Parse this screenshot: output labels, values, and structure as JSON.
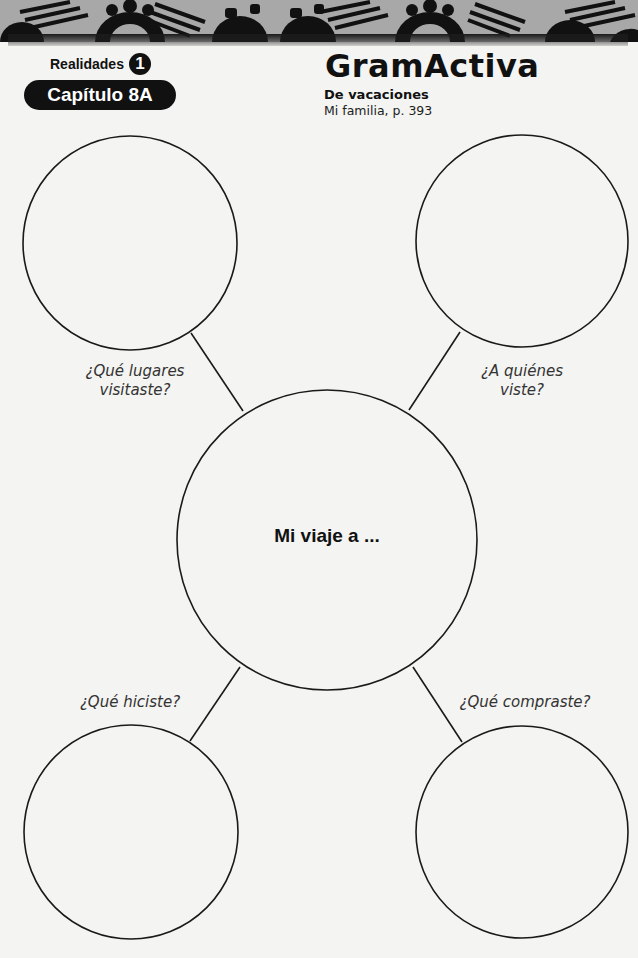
{
  "header": {
    "series": "Realidades",
    "level": "1",
    "chapter": "Capítulo 8A",
    "title": "GramActiva",
    "subtitle": "De vacaciones",
    "reference": "Mi familia,  p. 393"
  },
  "web": {
    "center": "Mi viaje a ...",
    "prompts": [
      {
        "id": "places",
        "text": "¿Qué lugares visitaste?",
        "line1": "¿Qué lugares",
        "line2": "visitaste?"
      },
      {
        "id": "people",
        "text": "¿A quiénes viste?",
        "line1": "¿A quiénes",
        "line2": "viste?"
      },
      {
        "id": "did",
        "text": "¿Qué hiciste?"
      },
      {
        "id": "bought",
        "text": "¿Qué compraste?"
      }
    ]
  },
  "colors": {
    "ink": "#111111",
    "paper": "#f4f4f2",
    "banner": "#a8a8a8"
  },
  "footer": {
    "page_number": "183"
  }
}
